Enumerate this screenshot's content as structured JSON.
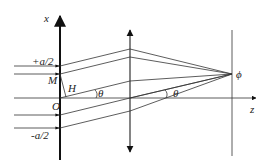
{
  "diagram": {
    "labels": {
      "x_axis": "x",
      "z_axis": "z",
      "top_slit": "+a/2",
      "bottom_slit": "-a/2",
      "point_M": "M",
      "point_H": "H",
      "origin": "O",
      "angle_1": "θ",
      "angle_2": "θ",
      "focal_point": "ϕ"
    },
    "elements": {
      "aperture_plane": "slit screen along x-axis",
      "lens": "converging lens (double-headed arrow)",
      "observation_screen": "vertical line at focal plane",
      "rays": "parallel incident rays diffracted at angle θ converging to ϕ"
    }
  }
}
